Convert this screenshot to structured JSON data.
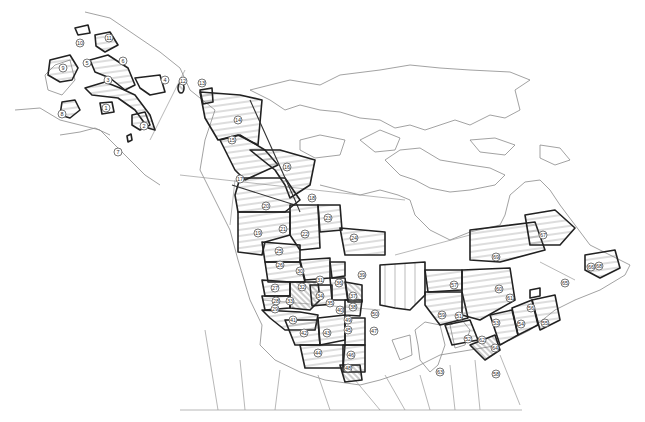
{
  "map": {
    "type": "survey strata map",
    "region": "North America (Alaska, Canada, northern United States)",
    "style": "black-and-white line art with hatched numbered strata",
    "colors": {
      "background": "#ffffff",
      "coastline": "#8a8a8a",
      "stratum_outline": "#222222",
      "label_circle": "#555555"
    },
    "labels": [
      {
        "id": "1",
        "x": 106,
        "y": 108
      },
      {
        "id": "2",
        "x": 144,
        "y": 126
      },
      {
        "id": "3",
        "x": 108,
        "y": 80
      },
      {
        "id": "4",
        "x": 165,
        "y": 80
      },
      {
        "id": "5",
        "x": 87,
        "y": 63
      },
      {
        "id": "6",
        "x": 123,
        "y": 61
      },
      {
        "id": "7",
        "x": 118,
        "y": 152
      },
      {
        "id": "8",
        "x": 62,
        "y": 114
      },
      {
        "id": "9",
        "x": 63,
        "y": 68
      },
      {
        "id": "10",
        "x": 80,
        "y": 43
      },
      {
        "id": "11",
        "x": 109,
        "y": 38
      },
      {
        "id": "12",
        "x": 183,
        "y": 81
      },
      {
        "id": "13",
        "x": 202,
        "y": 83
      },
      {
        "id": "14",
        "x": 238,
        "y": 120
      },
      {
        "id": "15",
        "x": 232,
        "y": 140
      },
      {
        "id": "16",
        "x": 287,
        "y": 167
      },
      {
        "id": "17",
        "x": 240,
        "y": 179
      },
      {
        "id": "18",
        "x": 312,
        "y": 198
      },
      {
        "id": "19",
        "x": 258,
        "y": 233
      },
      {
        "id": "20",
        "x": 266,
        "y": 206
      },
      {
        "id": "21",
        "x": 283,
        "y": 229
      },
      {
        "id": "22",
        "x": 305,
        "y": 234
      },
      {
        "id": "23",
        "x": 328,
        "y": 218
      },
      {
        "id": "24",
        "x": 354,
        "y": 238
      },
      {
        "id": "25",
        "x": 279,
        "y": 251
      },
      {
        "id": "26",
        "x": 280,
        "y": 265
      },
      {
        "id": "27",
        "x": 275,
        "y": 288
      },
      {
        "id": "28",
        "x": 276,
        "y": 301
      },
      {
        "id": "29",
        "x": 275,
        "y": 309
      },
      {
        "id": "30",
        "x": 300,
        "y": 271
      },
      {
        "id": "31",
        "x": 320,
        "y": 280
      },
      {
        "id": "32",
        "x": 302,
        "y": 287
      },
      {
        "id": "33",
        "x": 290,
        "y": 301
      },
      {
        "id": "34",
        "x": 320,
        "y": 296
      },
      {
        "id": "35",
        "x": 330,
        "y": 303
      },
      {
        "id": "36",
        "x": 339,
        "y": 283
      },
      {
        "id": "37",
        "x": 353,
        "y": 296
      },
      {
        "id": "38",
        "x": 353,
        "y": 307
      },
      {
        "id": "39",
        "x": 362,
        "y": 275
      },
      {
        "id": "40",
        "x": 340,
        "y": 310
      },
      {
        "id": "41",
        "x": 293,
        "y": 320
      },
      {
        "id": "42",
        "x": 304,
        "y": 333
      },
      {
        "id": "43",
        "x": 327,
        "y": 333
      },
      {
        "id": "44",
        "x": 318,
        "y": 353
      },
      {
        "id": "45",
        "x": 348,
        "y": 330
      },
      {
        "id": "46",
        "x": 351,
        "y": 355
      },
      {
        "id": "47",
        "x": 374,
        "y": 331
      },
      {
        "id": "48",
        "x": 348,
        "y": 368
      },
      {
        "id": "49",
        "x": 348,
        "y": 320
      },
      {
        "id": "50",
        "x": 375,
        "y": 314
      },
      {
        "id": "51",
        "x": 459,
        "y": 316
      },
      {
        "id": "52",
        "x": 468,
        "y": 339
      },
      {
        "id": "53",
        "x": 496,
        "y": 323
      },
      {
        "id": "54",
        "x": 521,
        "y": 324
      },
      {
        "id": "55",
        "x": 545,
        "y": 323
      },
      {
        "id": "56",
        "x": 531,
        "y": 308
      },
      {
        "id": "57",
        "x": 454,
        "y": 285
      },
      {
        "id": "58",
        "x": 496,
        "y": 374
      },
      {
        "id": "59",
        "x": 442,
        "y": 315
      },
      {
        "id": "60",
        "x": 499,
        "y": 289
      },
      {
        "id": "61",
        "x": 510,
        "y": 298
      },
      {
        "id": "62",
        "x": 482,
        "y": 340
      },
      {
        "id": "63",
        "x": 440,
        "y": 372
      },
      {
        "id": "64",
        "x": 495,
        "y": 348
      },
      {
        "id": "65",
        "x": 565,
        "y": 283
      },
      {
        "id": "66",
        "x": 591,
        "y": 267
      },
      {
        "id": "67",
        "x": 543,
        "y": 235
      },
      {
        "id": "68",
        "x": 599,
        "y": 266
      },
      {
        "id": "69",
        "x": 496,
        "y": 257
      }
    ]
  }
}
